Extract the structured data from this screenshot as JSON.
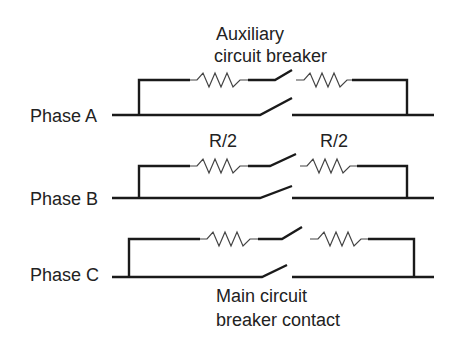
{
  "diagram": {
    "title_top": [
      "Auxiliary",
      "circuit breaker"
    ],
    "resistor_labels": [
      "R/2",
      "R/2"
    ],
    "phases": [
      "Phase A",
      "Phase B",
      "Phase C"
    ],
    "bottom_label": [
      "Main circuit",
      "breaker contact"
    ]
  }
}
